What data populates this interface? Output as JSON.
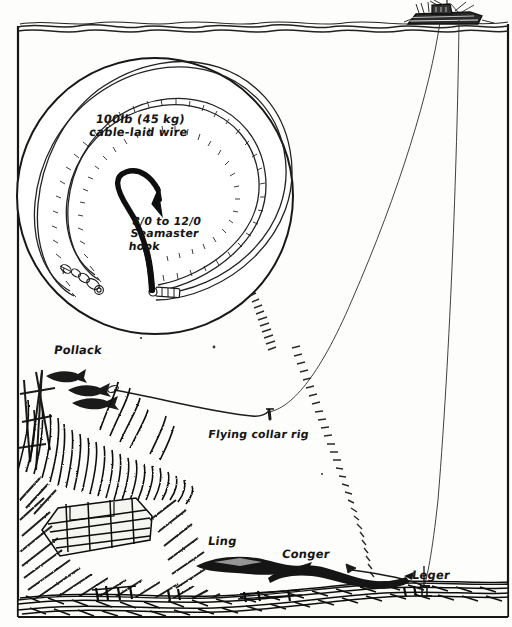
{
  "figure": {
    "type": "hand-drawn cutaway illustration",
    "ink_color": "#151515",
    "paper_color": "#fdfdfb"
  },
  "labels": {
    "wire": "100lb (45 kg)\ncable-laid wire",
    "hook": "8/0 to 12/0\nSeamaster\nhook",
    "flying_collar_rig": "Flying collar rig",
    "pollack": "Pollack",
    "ling": "Ling",
    "conger": "Conger",
    "leger": "Leger"
  },
  "scene_elements": {
    "boat": "fishing-boat",
    "water_surface": "wavy-water-surface-line",
    "wreck": "sunken-shipwreck-with-weed",
    "seabed": "hatched-seabed",
    "detail_circle": "magnified-coiled-wire-trace",
    "callout": "hatched-magnification-leader-lines",
    "fishing_lines": 2,
    "pollack_count": 3,
    "ling_count": 1,
    "conger_count": 1
  }
}
